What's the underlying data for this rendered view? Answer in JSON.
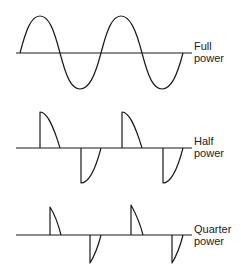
{
  "diagram": {
    "panels": [
      {
        "id": "full",
        "label_line1": "Full",
        "label_line2": "power",
        "conduction": "full"
      },
      {
        "id": "half",
        "label_line1": "Half",
        "label_line2": "power",
        "conduction": "half"
      },
      {
        "id": "quarter",
        "label_line1": "Quarter",
        "label_line2": "power",
        "conduction": "quarter"
      }
    ],
    "colors": {
      "line": "#1a1a1a",
      "background": "#ffffff"
    }
  }
}
